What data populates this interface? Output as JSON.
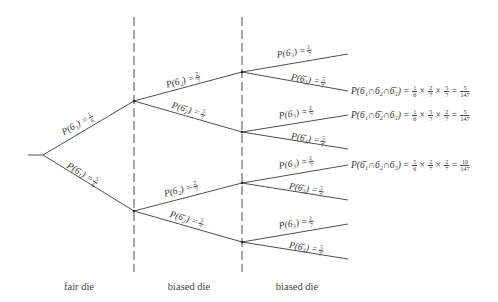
{
  "diagram": {
    "type": "probability-tree",
    "stages": [
      {
        "label": "fair die"
      },
      {
        "label": "biased die"
      },
      {
        "label": "biased die"
      }
    ],
    "branches": {
      "stage1": [
        {
          "event": "6",
          "sub": "1",
          "complement": false,
          "prob_num": "1",
          "prob_den": "6"
        },
        {
          "event": "6",
          "sub": "1",
          "complement": true,
          "prob_num": "5",
          "prob_den": "6"
        }
      ],
      "stage2": [
        {
          "event": "6",
          "sub": "2",
          "complement": false,
          "prob_num": "2",
          "prob_den": "7"
        },
        {
          "event": "6",
          "sub": "2",
          "complement": true,
          "prob_num": "5",
          "prob_den": "7"
        },
        {
          "event": "6",
          "sub": "2",
          "complement": false,
          "prob_num": "2",
          "prob_den": "7"
        },
        {
          "event": "6",
          "sub": "2",
          "complement": true,
          "prob_num": "5",
          "prob_den": "7"
        }
      ],
      "stage3": [
        {
          "event": "6",
          "sub": "3",
          "complement": false,
          "prob_num": "2",
          "prob_den": "7"
        },
        {
          "event": "6",
          "sub": "3",
          "complement": true,
          "prob_num": "5",
          "prob_den": "7"
        },
        {
          "event": "6",
          "sub": "3",
          "complement": false,
          "prob_num": "2",
          "prob_den": "7"
        },
        {
          "event": "6",
          "sub": "3",
          "complement": true,
          "prob_num": "5",
          "prob_den": "7"
        },
        {
          "event": "6",
          "sub": "3",
          "complement": false,
          "prob_num": "2",
          "prob_den": "7"
        },
        {
          "event": "6",
          "sub": "3",
          "complement": true,
          "prob_num": "5",
          "prob_den": "7"
        },
        {
          "event": "6",
          "sub": "3",
          "complement": false,
          "prob_num": "2",
          "prob_den": "7"
        },
        {
          "event": "6",
          "sub": "3",
          "complement": true,
          "prob_num": "5",
          "prob_den": "7"
        }
      ]
    },
    "results": [
      {
        "expr": "P(6₁∩6₂∩6̄₃)",
        "factors": [
          [
            "1",
            "6"
          ],
          [
            "2",
            "7"
          ],
          [
            "5",
            "7"
          ]
        ],
        "answer": [
          "5",
          "147"
        ]
      },
      {
        "expr": "P(6₁∩6̄₂∩6₃)",
        "factors": [
          [
            "1",
            "6"
          ],
          [
            "5",
            "7"
          ],
          [
            "2",
            "7"
          ]
        ],
        "answer": [
          "5",
          "147"
        ]
      },
      {
        "expr": "P(6̄₁∩6₂∩6₃)",
        "factors": [
          [
            "5",
            "6"
          ],
          [
            "2",
            "7"
          ],
          [
            "2",
            "7"
          ]
        ],
        "answer": [
          "10",
          "147"
        ]
      }
    ],
    "labels": {
      "s1": [
        "P(6₁) =",
        "P(6̄₁) ="
      ],
      "s2": [
        "P(6₂) =",
        "P(6̄₂) =",
        "P(6₂) =",
        "P(6̄₂) ="
      ],
      "s3": [
        "P(6₃) =",
        "P(6̄₃) =",
        "P(6₃) =",
        "P(6̄₃) =",
        "P(6₃) =",
        "P(6̄₃) =",
        "P(6₃) =",
        "P(6̄₃) ="
      ]
    },
    "times": "×",
    "equals": "="
  }
}
